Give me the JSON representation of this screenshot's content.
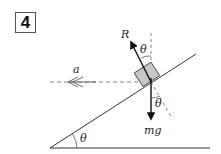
{
  "problem_number": "4",
  "labels": {
    "normal_force": "R",
    "acceleration": "a",
    "weight": "mg",
    "angle_top": "θ",
    "angle_bottom": "θ",
    "angle_incline": "θ"
  },
  "colors": {
    "line": "#333333",
    "dashed": "#777777",
    "block_fill": "#c8c8c8",
    "block_stroke": "#444444"
  }
}
